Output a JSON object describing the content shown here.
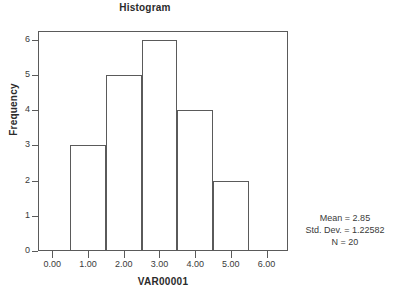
{
  "chart_data": {
    "type": "bar",
    "title": "Histogram",
    "xlabel": "VAR00001",
    "ylabel": "Frequency",
    "categories": [
      "1.00",
      "2.00",
      "3.00",
      "4.00",
      "5.00"
    ],
    "bin_edges": [
      0.5,
      1.5,
      2.5,
      3.5,
      4.5,
      5.5
    ],
    "bin_centers": [
      1,
      2,
      3,
      4,
      5
    ],
    "values": [
      3,
      5,
      6,
      4,
      2
    ],
    "bars": [
      {
        "label": "bin-0.5-1.5",
        "left": 0.5,
        "right": 1.5,
        "value": 3
      },
      {
        "label": "bin-1.5-2.5",
        "left": 1.5,
        "right": 2.5,
        "value": 5
      },
      {
        "label": "bin-2.5-3.5",
        "left": 2.5,
        "right": 3.5,
        "value": 6
      },
      {
        "label": "bin-3.5-4.5",
        "left": 3.5,
        "right": 4.5,
        "value": 4
      },
      {
        "label": "bin-4.5-5.5",
        "left": 4.5,
        "right": 5.5,
        "value": 2
      }
    ],
    "xlim": [
      -0.4,
      6.6
    ],
    "ylim": [
      0,
      6.25
    ],
    "xticks": [
      0,
      1,
      2,
      3,
      4,
      5,
      6
    ],
    "xtick_labels": [
      "0.00",
      "1.00",
      "2.00",
      "3.00",
      "4.00",
      "5.00",
      "6.00"
    ],
    "yticks": [
      0,
      1,
      2,
      3,
      4,
      5,
      6
    ],
    "ytick_labels": [
      "0",
      "1",
      "2",
      "3",
      "4",
      "5",
      "6"
    ],
    "grid": false,
    "legend": null,
    "bar_fill": "none",
    "line_color": "#5a5a5a",
    "annotations": {
      "mean": "Mean = 2.85",
      "std_dev": "Std. Dev. = 1.22582",
      "n": "N = 20"
    }
  }
}
